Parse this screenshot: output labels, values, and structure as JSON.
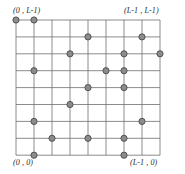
{
  "figure": {
    "grid": {
      "columns": 8,
      "rows": 8,
      "x0": 16,
      "y0": 20,
      "cell_width": 18,
      "cell_height": 16.9,
      "line_color": "#6e6e6e",
      "line_width": 0.8,
      "background": "#ffffff"
    },
    "dot": {
      "radius": 3.1,
      "fill": "#8c8c8c",
      "stroke": "#4a4a4a",
      "stroke_width": 0.9
    },
    "labels": {
      "top_left": "(0 , L-1)",
      "top_right": "(L-1 , L-1)",
      "bottom_left": "(0 , 0)",
      "bottom_right": "(L-1 , 0)"
    }
  },
  "chart_data": {
    "type": "scatter",
    "xlabel": "",
    "ylabel": "",
    "xlim": [
      0,
      8
    ],
    "ylim": [
      0,
      8
    ],
    "grid": true,
    "legend": null,
    "annotations": [
      {
        "text": "(0 , L-1)",
        "x": 0,
        "y": 8,
        "position": "top-left"
      },
      {
        "text": "(L-1 , L-1)",
        "x": 8,
        "y": 8,
        "position": "top-right"
      },
      {
        "text": "(0 , 0)",
        "x": 0,
        "y": 0,
        "position": "bottom-left"
      },
      {
        "text": "(L-1 , 0)",
        "x": 8,
        "y": 0,
        "position": "bottom-right"
      }
    ],
    "x_ticks": [
      0,
      1,
      2,
      3,
      4,
      5,
      6,
      7,
      8
    ],
    "y_ticks": [
      0,
      1,
      2,
      3,
      4,
      5,
      6,
      7,
      8
    ],
    "series": [
      {
        "name": "occupied sites",
        "marker": "circle",
        "color": "#8c8c8c",
        "points": [
          {
            "col": 0,
            "row": 0
          },
          {
            "col": 1,
            "row": 0
          },
          {
            "col": 4,
            "row": 1
          },
          {
            "col": 7,
            "row": 1
          },
          {
            "col": 3,
            "row": 2
          },
          {
            "col": 6,
            "row": 2
          },
          {
            "col": 8,
            "row": 2
          },
          {
            "col": 1,
            "row": 3
          },
          {
            "col": 5,
            "row": 3
          },
          {
            "col": 6,
            "row": 3
          },
          {
            "col": 4,
            "row": 4
          },
          {
            "col": 6,
            "row": 4
          },
          {
            "col": 3,
            "row": 5
          },
          {
            "col": 1,
            "row": 6
          },
          {
            "col": 7,
            "row": 6
          },
          {
            "col": 2,
            "row": 7
          },
          {
            "col": 4,
            "row": 7
          },
          {
            "col": 6,
            "row": 7
          },
          {
            "col": 1,
            "row": 8
          },
          {
            "col": 6,
            "row": 8
          }
        ]
      }
    ]
  }
}
